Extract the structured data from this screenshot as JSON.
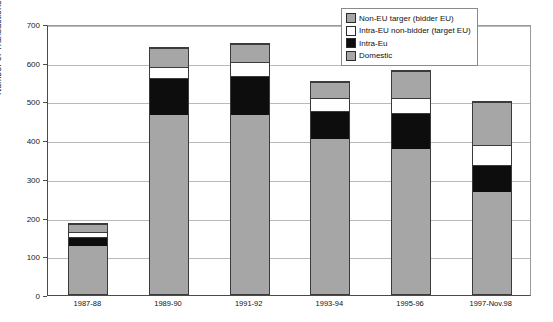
{
  "chart_data": {
    "type": "bar",
    "subtype": "stacked-vertical",
    "title": "",
    "xlabel": "",
    "ylabel": "Number of Transactions",
    "ylim": [
      0,
      700
    ],
    "ytick_step": 100,
    "yticks": [
      700,
      600,
      500,
      400,
      300,
      200,
      100,
      0
    ],
    "grid": true,
    "legend_position": "top-right",
    "categories": [
      "1987-88",
      "1989-90",
      "1991-92",
      "1993-94",
      "1995-96",
      "1997-Nov.98"
    ],
    "series": [
      {
        "name": "Domestic",
        "key": "domestic",
        "color": "#a6a6a6",
        "values": [
          128,
          465,
          467,
          403,
          378,
          265
        ]
      },
      {
        "name": "Intra-Eu",
        "key": "intraeu",
        "color": "#0d0d0d",
        "values": [
          22,
          95,
          98,
          72,
          92,
          68
        ]
      },
      {
        "name": "Intra-EU non-bidder (target EU)",
        "key": "nonbidder",
        "color": "#ffffff",
        "values": [
          15,
          30,
          40,
          37,
          40,
          55
        ]
      },
      {
        "name": "Non-EU targer (bidder EU)",
        "key": "noneu",
        "color": "#a6a6a6",
        "values": [
          20,
          50,
          45,
          41,
          70,
          112
        ]
      }
    ],
    "totals": [
      185,
      640,
      650,
      553,
      580,
      500
    ],
    "legend_order": [
      "Non-EU targer (bidder EU)",
      "Intra-EU non-bidder (target EU)",
      "Intra-Eu",
      "Domestic"
    ]
  },
  "legend": {
    "items": [
      {
        "label": "Non-EU targer (bidder EU)",
        "swatch": "swatch-gray",
        "color": "#a6a6a6"
      },
      {
        "label": "Intra-EU non-bidder (target EU)",
        "swatch": "swatch-white",
        "color": "#ffffff"
      },
      {
        "label": "Intra-Eu",
        "swatch": "swatch-black",
        "color": "#0d0d0d"
      },
      {
        "label": "Domestic",
        "swatch": "swatch-gray-hatch",
        "color": "#a6a6a6"
      }
    ]
  },
  "axes": {
    "y_title": "Number of Transactions",
    "y_ticks": [
      "700",
      "600",
      "500",
      "400",
      "300",
      "200",
      "100",
      "0"
    ],
    "x_ticks": [
      "1987-88",
      "1989-90",
      "1991-92",
      "1993-94",
      "1995-96",
      "1997-Nov.98"
    ]
  }
}
